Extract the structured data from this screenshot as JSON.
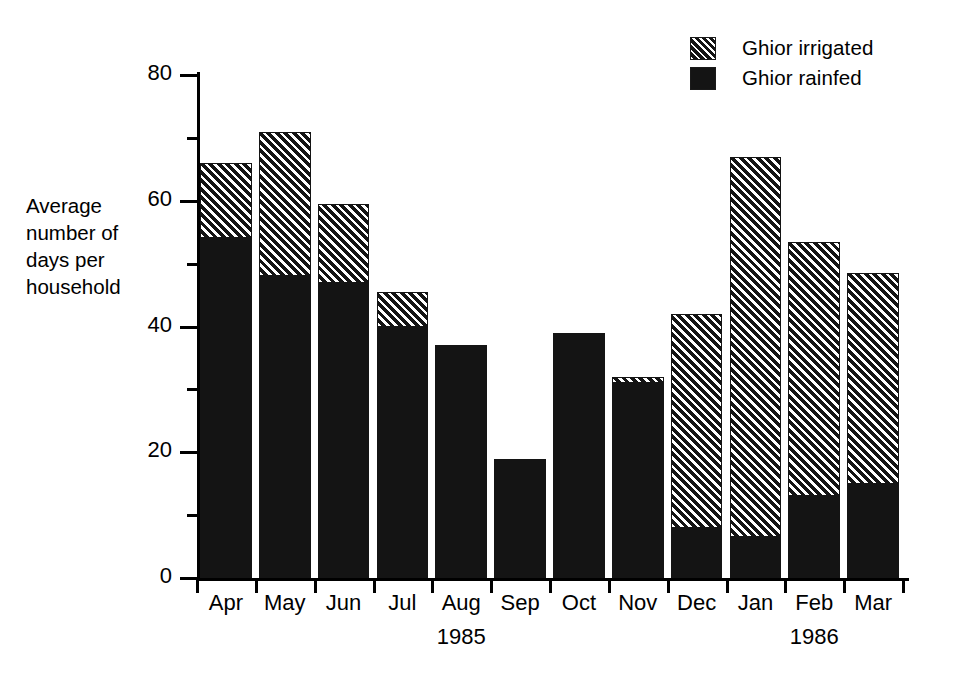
{
  "chart_data": {
    "type": "bar",
    "subtype": "stacked-vertical",
    "title": "",
    "xlabel": "",
    "ylabel": "Average number of days per household",
    "ylabel_lines": [
      "Average",
      "number of",
      "days per",
      "household"
    ],
    "ylim": [
      0,
      80
    ],
    "ytick_values": [
      0,
      20,
      40,
      60,
      80
    ],
    "ytick_labels": [
      "0",
      "20",
      "40",
      "60",
      "80"
    ],
    "yminor_values": [
      10,
      30,
      50,
      70
    ],
    "grid": false,
    "legend_position": "top-right",
    "categories": [
      "Apr",
      "May",
      "Jun",
      "Jul",
      "Aug",
      "Sep",
      "Oct",
      "Nov",
      "Dec",
      "Jan",
      "Feb",
      "Mar"
    ],
    "year_annotations": [
      {
        "label": "1985",
        "under_category": "Aug"
      },
      {
        "label": "1986",
        "under_category": "Feb"
      }
    ],
    "series": [
      {
        "name": "Ghior rainfed",
        "pattern": "solid",
        "color": "#141414",
        "values": [
          54,
          48,
          47,
          40,
          37,
          19,
          39,
          31,
          8,
          6.5,
          13,
          15
        ]
      },
      {
        "name": "Ghior irrigated",
        "pattern": "diagonal-hatch",
        "color": "#141414",
        "values": [
          12,
          23,
          12.5,
          5.5,
          0,
          0,
          0,
          1,
          34,
          60.5,
          40.5,
          33.5
        ]
      }
    ],
    "totals": [
      66,
      71,
      59.5,
      45.5,
      37,
      19,
      39,
      32,
      42,
      67,
      53.5,
      48.5
    ]
  },
  "legend": {
    "items": [
      {
        "label": "Ghior irrigated",
        "pattern": "hatch"
      },
      {
        "label": "Ghior rainfed",
        "pattern": "solid"
      }
    ]
  },
  "colors": {
    "ink": "#141414",
    "background": "#ffffff"
  }
}
